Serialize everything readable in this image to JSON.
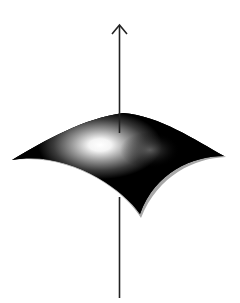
{
  "figure": {
    "colors": {
      "background": "#ffffff",
      "surface": "#000000",
      "highlight": "#ffffff",
      "shadow_edge": "#a8a8a8",
      "axis": "#222222"
    },
    "axis": {
      "x": 119.5,
      "arrow_tip_y": 25,
      "upper_line_bottom_y": 133,
      "lower_line_top_y": 197,
      "lower_line_bottom_y": 298
    },
    "surface_corners": {
      "left": [
        12,
        160
      ],
      "top": [
        123,
        113
      ],
      "right": [
        224,
        157
      ],
      "bottom": [
        140,
        215
      ]
    }
  }
}
